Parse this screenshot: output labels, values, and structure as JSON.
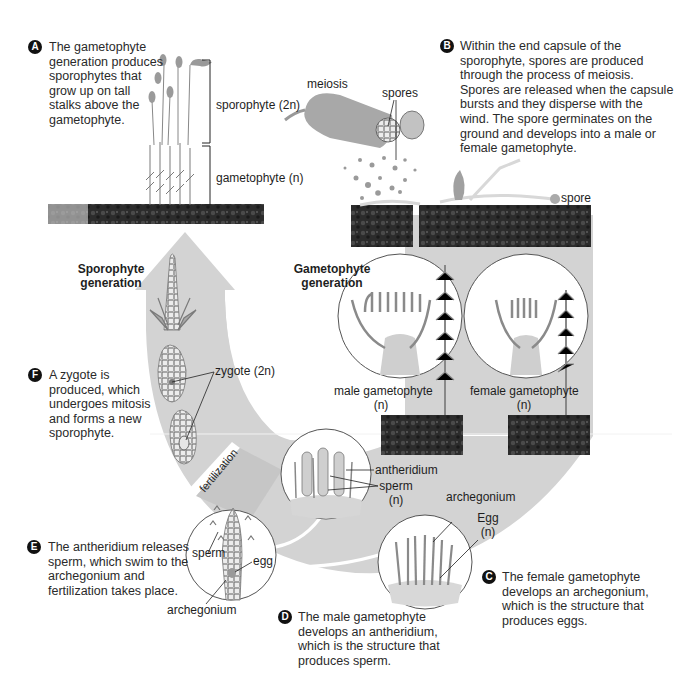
{
  "colors": {
    "band": "#d2d2d2",
    "band_dark": "#c4c4c4",
    "soil": "#2e2e2e",
    "plant": "#8a8a8a",
    "background": "#ffffff",
    "badge": "#111111"
  },
  "generations": {
    "sporophyte": "Sporophyte\ngeneration",
    "sporophyte_line1": "Sporophyte",
    "sporophyte_line2": "generation",
    "gametophyte_line1": "Gametophyte",
    "gametophyte_line2": "generation"
  },
  "steps": [
    {
      "badge": "A",
      "lines": [
        "The gametophyte",
        "generation produces",
        "sporophytes that",
        "grow up on tall",
        "stalks above the",
        "gametophyte."
      ]
    },
    {
      "badge": "B",
      "lines": [
        "Within the end capsule of the",
        "sporophyte, spores are produced",
        "through the process of meiosis.",
        "Spores are released when the capsule",
        "bursts and they disperse with the",
        "wind. The spore germinates on the",
        "ground and develops into a male or",
        "female gametophyte."
      ]
    },
    {
      "badge": "C",
      "lines": [
        "The female gametophyte",
        "develops an archegonium,",
        "which is the structure that",
        "produces eggs."
      ]
    },
    {
      "badge": "D",
      "lines": [
        "The male gametophyte",
        "develops an antheridium,",
        "which is the structure that",
        "produces sperm."
      ]
    },
    {
      "badge": "E",
      "lines": [
        "The antheridium releases",
        "sperm, which swim to the",
        "archegonium and",
        "fertilization takes place."
      ]
    },
    {
      "badge": "F",
      "lines": [
        "A zygote is",
        "produced, which",
        "undergoes mitosis",
        "and forms a new",
        "sporophyte."
      ]
    }
  ],
  "labels": {
    "sporophyte_2n": "sporophyte (2n)",
    "gametophyte_n": "gametophyte (n)",
    "meiosis": "meiosis",
    "spores": "spores",
    "spore": "spore",
    "male_gametophyte": "male gametophyte",
    "male_n": "(n)",
    "female_gametophyte": "female gametophyte",
    "female_n": "(n)",
    "antheridium": "antheridium",
    "sperm_n_1": "sperm",
    "sperm_n_2": "(n)",
    "archegonium_c": "archegonium",
    "egg_n_1": "Egg",
    "egg_n_2": "(n)",
    "zygote": "zygote (2n)",
    "fertilization": "fertilization",
    "sperm_e": "sperm",
    "egg_e": "egg",
    "archegonium_e": "archegonium"
  }
}
